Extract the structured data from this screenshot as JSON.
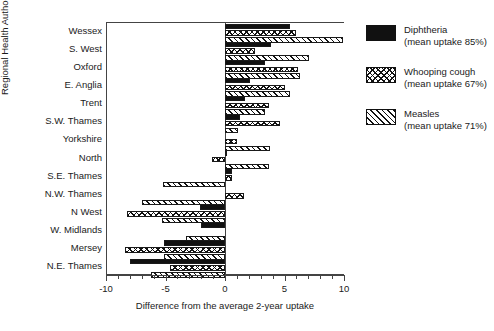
{
  "chart_data": {
    "type": "bar",
    "orientation": "horizontal",
    "title": "",
    "xlabel": "Difference from the average 2-year uptake",
    "ylabel": "Regional Health Authority",
    "xlim": [
      -10,
      10
    ],
    "xticks": [
      -10,
      -5,
      0,
      5,
      10
    ],
    "xtick_labels": [
      "-10",
      "-5",
      "0",
      "5",
      "10"
    ],
    "grid": false,
    "legend_position": "right",
    "categories": [
      "Wessex",
      "S. West",
      "Oxford",
      "E. Anglia",
      "Trent",
      "S.W. Thames",
      "Yorkshire",
      "North",
      "S.E. Thames",
      "N.W. Thames",
      "N West",
      "W. Midlands",
      "Mersey",
      "N.E. Thames"
    ],
    "series": [
      {
        "name": "Diphtheria",
        "legend_label": "Diphtheria",
        "legend_sub": "(mean uptake 85%)",
        "fill": "solid-black",
        "values": [
          5.5,
          3.9,
          3.4,
          2.1,
          1.7,
          1.3,
          0.0,
          0.1,
          0.6,
          0.0,
          -2.1,
          -2.0,
          -5.1,
          -8.0
        ]
      },
      {
        "name": "Whooping cough",
        "legend_label": "Whooping cough",
        "legend_sub": "(mean uptake 67%)",
        "fill": "crosshatch",
        "values": [
          6.0,
          2.5,
          6.1,
          5.0,
          3.7,
          4.6,
          1.0,
          -1.1,
          0.6,
          1.6,
          -8.2,
          0.0,
          -8.4,
          -4.6
        ]
      },
      {
        "name": "Measles",
        "legend_label": "Measles",
        "legend_sub": "(mean uptake 71%)",
        "fill": "diagonal-hatch",
        "values": [
          9.9,
          7.1,
          6.3,
          5.5,
          3.4,
          1.1,
          3.8,
          3.7,
          -5.2,
          -7.0,
          -5.3,
          -3.3,
          -5.1,
          -6.2
        ]
      }
    ]
  }
}
